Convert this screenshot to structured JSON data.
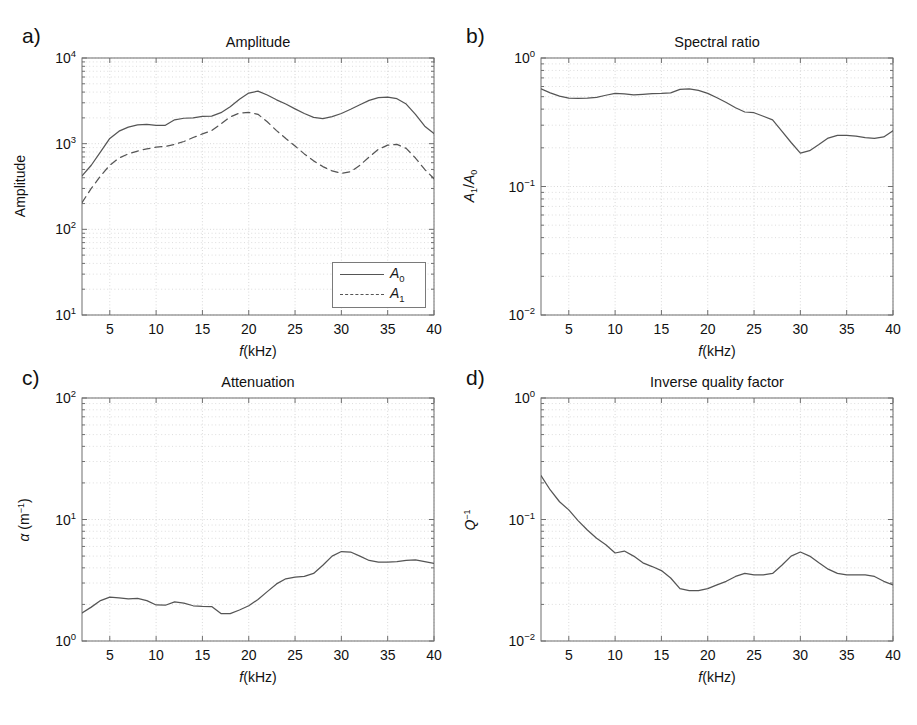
{
  "figure": {
    "panels": [
      {
        "key": "a",
        "label": "a)",
        "title": "Amplitude",
        "xlabel_italic": "f",
        "xlabel_rest": "(kHz)",
        "ylabel": "Amplitude",
        "ylabel_type": "plain",
        "x_ticks": [
          "5",
          "10",
          "15",
          "20",
          "25",
          "30",
          "35",
          "40"
        ],
        "x_tick_values": [
          5,
          10,
          15,
          20,
          25,
          30,
          35,
          40
        ],
        "y_ticks": [
          "10<sup>1</sup>",
          "10<sup>2</sup>",
          "10<sup>3</sup>",
          "10<sup>4</sup>"
        ],
        "legend": [
          {
            "name": "A0",
            "text": "A<sub>0</sub>",
            "style": "solid"
          },
          {
            "name": "A1",
            "text": "A<sub>1</sub>",
            "style": "dashed"
          }
        ]
      },
      {
        "key": "b",
        "label": "b)",
        "title": "Spectral ratio",
        "xlabel_italic": "f",
        "xlabel_rest": "(kHz)",
        "ylabel": "A1/A0",
        "ylabel_type": "ratio",
        "x_ticks": [
          "5",
          "10",
          "15",
          "20",
          "25",
          "30",
          "35",
          "40"
        ],
        "x_tick_values": [
          5,
          10,
          15,
          20,
          25,
          30,
          35,
          40
        ],
        "y_ticks": [
          "10<sup>-2</sup>",
          "10<sup>-1</sup>",
          "10<sup>0</sup>"
        ]
      },
      {
        "key": "c",
        "label": "c)",
        "title": "Attenuation",
        "xlabel_italic": "f",
        "xlabel_rest": "(kHz)",
        "ylabel": "alpha (m-1)",
        "ylabel_type": "alpha",
        "x_ticks": [
          "5",
          "10",
          "15",
          "20",
          "25",
          "30",
          "35",
          "40"
        ],
        "x_tick_values": [
          5,
          10,
          15,
          20,
          25,
          30,
          35,
          40
        ],
        "y_ticks": [
          "10<sup>0</sup>",
          "10<sup>1</sup>",
          "10<sup>2</sup>"
        ]
      },
      {
        "key": "d",
        "label": "d)",
        "title": "Inverse quality factor",
        "xlabel_italic": "f",
        "xlabel_rest": "(kHz)",
        "ylabel": "Q-1",
        "ylabel_type": "qinv",
        "x_ticks": [
          "5",
          "10",
          "15",
          "20",
          "25",
          "30",
          "35",
          "40"
        ],
        "x_tick_values": [
          5,
          10,
          15,
          20,
          25,
          30,
          35,
          40
        ],
        "y_ticks": [
          "10<sup>-2</sup>",
          "10<sup>-1</sup>",
          "10<sup>0</sup>"
        ]
      }
    ]
  },
  "chart_data": [
    {
      "panel": "a",
      "type": "line",
      "title": "Amplitude",
      "xlabel": "f(kHz)",
      "ylabel": "Amplitude",
      "xscale": "linear",
      "yscale": "log",
      "xlim": [
        2,
        40
      ],
      "ylim": [
        10,
        10000
      ],
      "grid": true,
      "legend_position": "lower right",
      "x": [
        2,
        3,
        4,
        5,
        6,
        7,
        8,
        9,
        10,
        11,
        12,
        13,
        14,
        15,
        16,
        17,
        18,
        19,
        20,
        21,
        22,
        23,
        24,
        25,
        26,
        27,
        28,
        29,
        30,
        31,
        32,
        33,
        34,
        35,
        36,
        37,
        38,
        39,
        40
      ],
      "series": [
        {
          "name": "A0",
          "style": "solid",
          "values": [
            420,
            560,
            800,
            1150,
            1400,
            1560,
            1660,
            1680,
            1640,
            1640,
            1900,
            1980,
            2000,
            2080,
            2100,
            2300,
            2700,
            3300,
            3900,
            4100,
            3700,
            3250,
            2900,
            2550,
            2250,
            2030,
            1960,
            2070,
            2250,
            2520,
            2850,
            3200,
            3450,
            3500,
            3350,
            2900,
            2200,
            1600,
            1310
          ]
        },
        {
          "name": "A1",
          "style": "dashed",
          "values": [
            205,
            300,
            420,
            560,
            680,
            760,
            820,
            870,
            910,
            930,
            980,
            1060,
            1180,
            1300,
            1420,
            1700,
            2050,
            2280,
            2320,
            2200,
            1800,
            1420,
            1150,
            940,
            760,
            630,
            540,
            480,
            450,
            470,
            560,
            700,
            860,
            960,
            980,
            880,
            680,
            500,
            390
          ]
        }
      ]
    },
    {
      "panel": "b",
      "type": "line",
      "title": "Spectral ratio",
      "xlabel": "f(kHz)",
      "ylabel": "A1/A0",
      "xscale": "linear",
      "yscale": "log",
      "xlim": [
        2,
        40
      ],
      "ylim": [
        0.01,
        1
      ],
      "grid": true,
      "x": [
        2,
        3,
        4,
        5,
        6,
        7,
        8,
        9,
        10,
        11,
        12,
        13,
        14,
        15,
        16,
        17,
        18,
        19,
        20,
        21,
        22,
        23,
        24,
        25,
        26,
        27,
        28,
        29,
        30,
        31,
        32,
        33,
        34,
        35,
        36,
        37,
        38,
        39,
        40
      ],
      "series": [
        {
          "name": "A1/A0",
          "style": "solid",
          "values": [
            0.575,
            0.535,
            0.505,
            0.487,
            0.485,
            0.487,
            0.494,
            0.513,
            0.53,
            0.525,
            0.516,
            0.522,
            0.528,
            0.53,
            0.535,
            0.57,
            0.575,
            0.56,
            0.53,
            0.49,
            0.45,
            0.41,
            0.38,
            0.375,
            0.352,
            0.33,
            0.27,
            0.22,
            0.182,
            0.19,
            0.212,
            0.238,
            0.25,
            0.25,
            0.247,
            0.24,
            0.237,
            0.243,
            0.272
          ]
        }
      ]
    },
    {
      "panel": "c",
      "type": "line",
      "title": "Attenuation",
      "xlabel": "f(kHz)",
      "ylabel": "alpha (m^-1)",
      "xscale": "linear",
      "yscale": "log",
      "xlim": [
        2,
        40
      ],
      "ylim": [
        1,
        100
      ],
      "grid": true,
      "x": [
        2,
        3,
        4,
        5,
        6,
        7,
        8,
        9,
        10,
        11,
        12,
        13,
        14,
        15,
        16,
        17,
        18,
        19,
        20,
        21,
        22,
        23,
        24,
        25,
        26,
        27,
        28,
        29,
        30,
        31,
        32,
        33,
        34,
        35,
        36,
        37,
        38,
        39,
        40
      ],
      "series": [
        {
          "name": "alpha",
          "style": "solid",
          "values": [
            1.7,
            1.9,
            2.15,
            2.3,
            2.26,
            2.22,
            2.24,
            2.15,
            1.98,
            1.97,
            2.1,
            2.05,
            1.95,
            1.93,
            1.92,
            1.68,
            1.68,
            1.8,
            1.95,
            2.2,
            2.55,
            2.95,
            3.25,
            3.35,
            3.4,
            3.6,
            4.2,
            5.0,
            5.45,
            5.4,
            5.0,
            4.6,
            4.45,
            4.45,
            4.5,
            4.6,
            4.65,
            4.5,
            4.35
          ]
        }
      ]
    },
    {
      "panel": "d",
      "type": "line",
      "title": "Inverse quality factor",
      "xlabel": "f(kHz)",
      "ylabel": "Q^-1",
      "xscale": "linear",
      "yscale": "log",
      "xlim": [
        2,
        40
      ],
      "ylim": [
        0.01,
        1
      ],
      "grid": true,
      "x": [
        2,
        3,
        4,
        5,
        6,
        7,
        8,
        9,
        10,
        11,
        12,
        13,
        14,
        15,
        16,
        17,
        18,
        19,
        20,
        21,
        22,
        23,
        24,
        25,
        26,
        27,
        28,
        29,
        30,
        31,
        32,
        33,
        34,
        35,
        36,
        37,
        38,
        39,
        40
      ],
      "series": [
        {
          "name": "Qinv",
          "style": "solid",
          "values": [
            0.23,
            0.175,
            0.14,
            0.12,
            0.098,
            0.082,
            0.07,
            0.062,
            0.053,
            0.055,
            0.05,
            0.044,
            0.041,
            0.038,
            0.033,
            0.027,
            0.026,
            0.026,
            0.027,
            0.029,
            0.031,
            0.034,
            0.036,
            0.035,
            0.035,
            0.036,
            0.042,
            0.05,
            0.054,
            0.05,
            0.044,
            0.039,
            0.036,
            0.035,
            0.035,
            0.035,
            0.034,
            0.031,
            0.029
          ]
        }
      ]
    }
  ],
  "style": {
    "axis_color": "#6f6f6f",
    "curve_color": "#555555",
    "grid_color": "#cfcfcf",
    "text_color": "#141414",
    "background": "#ffffff"
  }
}
